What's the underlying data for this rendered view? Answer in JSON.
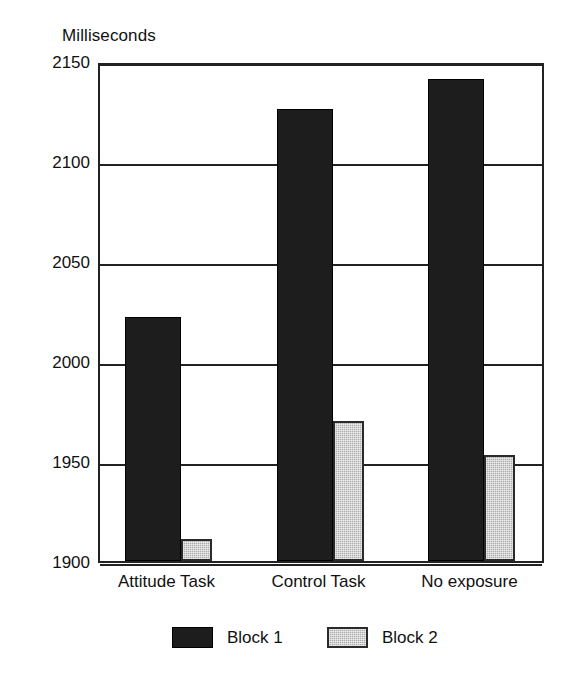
{
  "chart_data": {
    "type": "bar",
    "title": "",
    "ylabel": "Milliseconds",
    "xlabel": "",
    "categories": [
      "Attitude Task",
      "Control Task",
      "No exposure"
    ],
    "series": [
      {
        "name": "Block 1",
        "color": "#1d1d1d",
        "values": [
          2022,
          2126,
          2141
        ]
      },
      {
        "name": "Block 2",
        "color": "#adadad",
        "values": [
          1911,
          1970,
          1953
        ]
      }
    ],
    "ylim": [
      1900,
      2150
    ],
    "yticks": [
      2150,
      2100,
      2050,
      2000,
      1950,
      1900
    ],
    "ytick_labels": [
      "2150",
      "2100",
      "2050",
      "2000",
      "1950",
      "1900"
    ],
    "grid": true,
    "legend_position": "bottom",
    "legend": [
      "Block 1",
      "Block 2"
    ]
  },
  "axis": {
    "y_title": "Milliseconds"
  },
  "legend": {
    "items": [
      {
        "label": "Block 1",
        "swatch": "black-swatch"
      },
      {
        "label": "Block 2",
        "swatch": "gray-swatch"
      }
    ]
  }
}
